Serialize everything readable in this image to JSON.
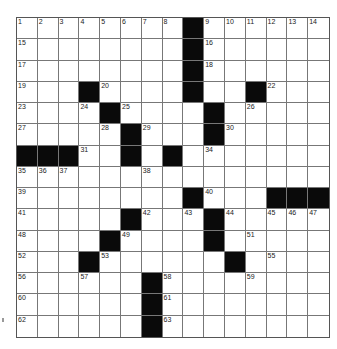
{
  "puzzle": {
    "rows": 15,
    "cols": 15,
    "layout": [
      "........#......",
      "........#......",
      "........#......",
      "...#....#..#...",
      "....#....#.....",
      ".....#...#.....",
      "###..#.#.......",
      "...............",
      "........#...###",
      ".....#...#.....",
      "....#....#.....",
      "...#......#....",
      "......#........",
      "......#........",
      "......#........"
    ],
    "numbers": [
      {
        "r": 0,
        "c": 0,
        "n": "1"
      },
      {
        "r": 0,
        "c": 1,
        "n": "2"
      },
      {
        "r": 0,
        "c": 2,
        "n": "3"
      },
      {
        "r": 0,
        "c": 3,
        "n": "4"
      },
      {
        "r": 0,
        "c": 4,
        "n": "5"
      },
      {
        "r": 0,
        "c": 5,
        "n": "6"
      },
      {
        "r": 0,
        "c": 6,
        "n": "7"
      },
      {
        "r": 0,
        "c": 7,
        "n": "8"
      },
      {
        "r": 0,
        "c": 9,
        "n": "9"
      },
      {
        "r": 0,
        "c": 10,
        "n": "10"
      },
      {
        "r": 0,
        "c": 11,
        "n": "11"
      },
      {
        "r": 0,
        "c": 12,
        "n": "12"
      },
      {
        "r": 0,
        "c": 13,
        "n": "13"
      },
      {
        "r": 0,
        "c": 14,
        "n": "14"
      },
      {
        "r": 1,
        "c": 0,
        "n": "15"
      },
      {
        "r": 1,
        "c": 9,
        "n": "16"
      },
      {
        "r": 2,
        "c": 0,
        "n": "17"
      },
      {
        "r": 2,
        "c": 9,
        "n": "18"
      },
      {
        "r": 3,
        "c": 0,
        "n": "19"
      },
      {
        "r": 3,
        "c": 4,
        "n": "20"
      },
      {
        "r": 3,
        "c": 8,
        "n": "21"
      },
      {
        "r": 3,
        "c": 12,
        "n": "22"
      },
      {
        "r": 4,
        "c": 0,
        "n": "23"
      },
      {
        "r": 4,
        "c": 3,
        "n": "24"
      },
      {
        "r": 4,
        "c": 5,
        "n": "25"
      },
      {
        "r": 4,
        "c": 11,
        "n": "26"
      },
      {
        "r": 5,
        "c": 0,
        "n": "27"
      },
      {
        "r": 5,
        "c": 4,
        "n": "28"
      },
      {
        "r": 5,
        "c": 6,
        "n": "29"
      },
      {
        "r": 5,
        "c": 10,
        "n": "30"
      },
      {
        "r": 6,
        "c": 3,
        "n": "31"
      },
      {
        "r": 6,
        "c": 5,
        "n": "32"
      },
      {
        "r": 6,
        "c": 7,
        "n": "33"
      },
      {
        "r": 6,
        "c": 9,
        "n": "34"
      },
      {
        "r": 7,
        "c": 0,
        "n": "35"
      },
      {
        "r": 7,
        "c": 1,
        "n": "36"
      },
      {
        "r": 7,
        "c": 2,
        "n": "37"
      },
      {
        "r": 7,
        "c": 6,
        "n": "38"
      },
      {
        "r": 8,
        "c": 0,
        "n": "39"
      },
      {
        "r": 8,
        "c": 9,
        "n": "40"
      },
      {
        "r": 9,
        "c": 0,
        "n": "41"
      },
      {
        "r": 9,
        "c": 6,
        "n": "42"
      },
      {
        "r": 9,
        "c": 8,
        "n": "43"
      },
      {
        "r": 9,
        "c": 10,
        "n": "44"
      },
      {
        "r": 9,
        "c": 12,
        "n": "45"
      },
      {
        "r": 9,
        "c": 13,
        "n": "46"
      },
      {
        "r": 9,
        "c": 14,
        "n": "47"
      },
      {
        "r": 10,
        "c": 0,
        "n": "48"
      },
      {
        "r": 10,
        "c": 5,
        "n": "49"
      },
      {
        "r": 10,
        "c": 9,
        "n": "50"
      },
      {
        "r": 10,
        "c": 11,
        "n": "51"
      },
      {
        "r": 11,
        "c": 0,
        "n": "52"
      },
      {
        "r": 11,
        "c": 4,
        "n": "53"
      },
      {
        "r": 11,
        "c": 10,
        "n": "54"
      },
      {
        "r": 11,
        "c": 12,
        "n": "55"
      },
      {
        "r": 12,
        "c": 0,
        "n": "56"
      },
      {
        "r": 12,
        "c": 3,
        "n": "57"
      },
      {
        "r": 12,
        "c": 7,
        "n": "58"
      },
      {
        "r": 12,
        "c": 11,
        "n": "59"
      },
      {
        "r": 13,
        "c": 0,
        "n": "60"
      },
      {
        "r": 13,
        "c": 7,
        "n": "61"
      },
      {
        "r": 14,
        "c": 0,
        "n": "62"
      },
      {
        "r": 14,
        "c": 7,
        "n": "63"
      }
    ]
  },
  "colors": {
    "black_square": "#0a0a0a",
    "grid_line": "#777777",
    "background": "#ffffff"
  }
}
